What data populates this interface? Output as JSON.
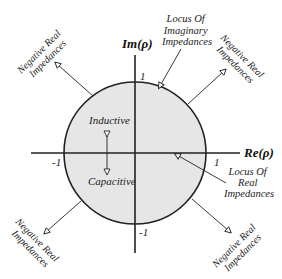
{
  "diagram": {
    "type": "smith-chart-reflection-plane",
    "colors": {
      "circle_fill": "#e6e6e6",
      "line": "#222222",
      "text": "#222222",
      "background": "#ffffff"
    },
    "axes": {
      "real_label": "Re(ρ)",
      "imag_label": "Im(ρ)",
      "ticks": {
        "pos_real": "1",
        "neg_real": "-1",
        "pos_imag": "1",
        "neg_imag": "-1"
      }
    },
    "regions": {
      "inductive": "Inductive",
      "capacitive": "Capacitive"
    },
    "annotations": {
      "locus_imaginary": [
        "Locus Of",
        "Imaginary",
        "Impedances"
      ],
      "locus_real": [
        "Locus Of",
        "Real",
        "Impedances"
      ],
      "negative_real_tl": [
        "Negative Real",
        "Impedances"
      ],
      "negative_real_tr": [
        "Negative Real",
        "Impedances"
      ],
      "negative_real_bl": [
        "Negative Real",
        "Impedances"
      ],
      "negative_real_br": [
        "Negative Real",
        "Impedances"
      ]
    }
  }
}
